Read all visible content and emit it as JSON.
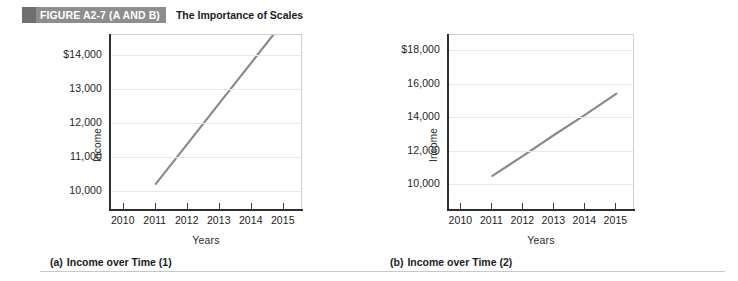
{
  "header": {
    "badge": "FIGURE A2-7 (A AND B)",
    "title": "The Importance of Scales",
    "badge_color": "#8d8d8d"
  },
  "line_color": "#8a8a8a",
  "chart_data": [
    {
      "type": "line",
      "panel": "a",
      "caption_tag": "(a)",
      "caption_text": "Income over Time (1)",
      "title": "Income over Time (1)",
      "xlabel": "Years",
      "ylabel": "Income",
      "x": [
        2011,
        2012,
        2013,
        2014,
        2015
      ],
      "categories": [
        "2010",
        "2011",
        "2012",
        "2013",
        "2014",
        "2015"
      ],
      "values": [
        10200,
        11400,
        12600,
        13800,
        15000
      ],
      "series": [
        {
          "name": "Income",
          "values": [
            10200,
            11400,
            12600,
            13800,
            15000
          ]
        }
      ],
      "yticks": [
        "$14,000",
        "13,000",
        "12,000",
        "11,000",
        "10,000"
      ],
      "ytick_values": [
        14000,
        13000,
        12000,
        11000,
        10000
      ],
      "ylim": [
        9400,
        14600
      ],
      "xlim": [
        2009.6,
        2015.6
      ],
      "grid": true,
      "legend": "none",
      "note": "steep-looking rise due to compressed y scale; line runs off top of plot past 2014"
    },
    {
      "type": "line",
      "panel": "b",
      "caption_tag": "(b)",
      "caption_text": "Income over Time (2)",
      "title": "Income over Time (2)",
      "xlabel": "Years",
      "ylabel": "Income",
      "x": [
        2011,
        2012,
        2013,
        2014,
        2015
      ],
      "categories": [
        "2010",
        "2011",
        "2012",
        "2013",
        "2014",
        "2015"
      ],
      "values": [
        10500,
        11700,
        12950,
        14150,
        15400
      ],
      "series": [
        {
          "name": "Income",
          "values": [
            10500,
            11700,
            12950,
            14150,
            15400
          ]
        }
      ],
      "yticks": [
        "$18,000",
        "16,000",
        "14,000",
        "12,000",
        "10,000"
      ],
      "ytick_values": [
        18000,
        16000,
        14000,
        12000,
        10000
      ],
      "ylim": [
        8400,
        18900
      ],
      "xlim": [
        2009.6,
        2015.6
      ],
      "grid": true,
      "legend": "none",
      "note": "same data trend appears gentler because the y scale is expanded"
    }
  ]
}
